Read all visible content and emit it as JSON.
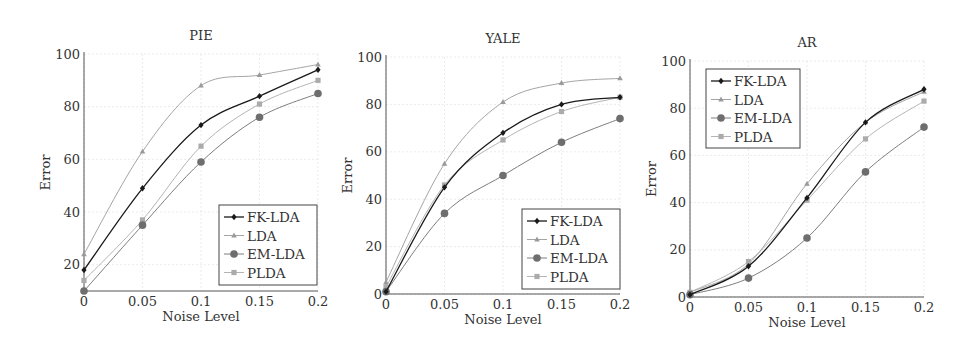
{
  "chart_data": [
    {
      "type": "line",
      "title": "PIE",
      "xlabel": "Noise Level",
      "ylabel": "Error",
      "x": [
        0,
        0.05,
        0.1,
        0.15,
        0.2
      ],
      "xticks": [
        "0",
        "0.05",
        "0.1",
        "0.15",
        "0.2"
      ],
      "yticks": [
        20,
        40,
        60,
        80,
        100
      ],
      "ylim": [
        10,
        100
      ],
      "xlim": [
        0,
        0.2
      ],
      "grid": true,
      "legend_position": "lower right",
      "series": [
        {
          "name": "FK-LDA",
          "values": [
            18,
            49,
            73,
            84,
            94
          ]
        },
        {
          "name": "LDA",
          "values": [
            24,
            63,
            88,
            92,
            96
          ]
        },
        {
          "name": "EM-LDA",
          "values": [
            10,
            35,
            59,
            76,
            85
          ]
        },
        {
          "name": "PLDA",
          "values": [
            14,
            37,
            65,
            81,
            90
          ]
        }
      ]
    },
    {
      "type": "line",
      "title": "YALE",
      "xlabel": "Noise Level",
      "ylabel": "Error",
      "x": [
        0,
        0.05,
        0.1,
        0.15,
        0.2
      ],
      "xticks": [
        "0",
        "0.05",
        "0.1",
        "0.15",
        "0.2"
      ],
      "yticks": [
        0,
        20,
        40,
        60,
        80,
        100
      ],
      "ylim": [
        0,
        100
      ],
      "xlim": [
        0,
        0.2
      ],
      "grid": true,
      "legend_position": "lower right",
      "series": [
        {
          "name": "FK-LDA",
          "values": [
            1,
            45,
            68,
            80,
            83
          ]
        },
        {
          "name": "LDA",
          "values": [
            5,
            55,
            81,
            89,
            91
          ]
        },
        {
          "name": "EM-LDA",
          "values": [
            1,
            34,
            50,
            64,
            74
          ]
        },
        {
          "name": "PLDA",
          "values": [
            3,
            46,
            65,
            77,
            83
          ]
        }
      ]
    },
    {
      "type": "line",
      "title": "AR",
      "xlabel": "Noise Level",
      "ylabel": "Error",
      "x": [
        0,
        0.05,
        0.1,
        0.15,
        0.2
      ],
      "xticks": [
        "0",
        "0.05",
        "0.1",
        "0.15",
        "0.2"
      ],
      "yticks": [
        0,
        20,
        40,
        60,
        80,
        100
      ],
      "ylim": [
        0,
        100
      ],
      "xlim": [
        0,
        0.2
      ],
      "grid": true,
      "legend_position": "upper left",
      "series": [
        {
          "name": "FK-LDA",
          "values": [
            1,
            13,
            42,
            74,
            88
          ]
        },
        {
          "name": "LDA",
          "values": [
            2,
            14,
            48,
            74,
            87
          ]
        },
        {
          "name": "EM-LDA",
          "values": [
            1,
            8,
            25,
            53,
            72
          ]
        },
        {
          "name": "PLDA",
          "values": [
            2,
            15,
            41,
            67,
            83
          ]
        }
      ]
    }
  ],
  "series_style": {
    "FK-LDA": {
      "color": "#1a1a1a",
      "marker": "diamond",
      "width": 1.3
    },
    "LDA": {
      "color": "#9a9a9a",
      "marker": "triangle",
      "width": 0.9
    },
    "EM-LDA": {
      "color": "#6e6e6e",
      "marker": "circle",
      "width": 0.9
    },
    "PLDA": {
      "color": "#ababab",
      "marker": "square",
      "width": 0.9
    }
  },
  "layout": [
    {
      "x0": 84,
      "x1": 318,
      "ytop": 54,
      "ybot": 291,
      "legend": {
        "x": 219,
        "y": 205,
        "w": 98,
        "h": 80
      }
    },
    {
      "x0": 386,
      "x1": 620,
      "ytop": 57,
      "ybot": 294,
      "legend": {
        "x": 522,
        "y": 209,
        "w": 98,
        "h": 80
      }
    },
    {
      "x0": 690,
      "x1": 924,
      "ytop": 61,
      "ybot": 297,
      "legend": {
        "x": 706,
        "y": 69,
        "w": 94,
        "h": 79
      }
    }
  ]
}
